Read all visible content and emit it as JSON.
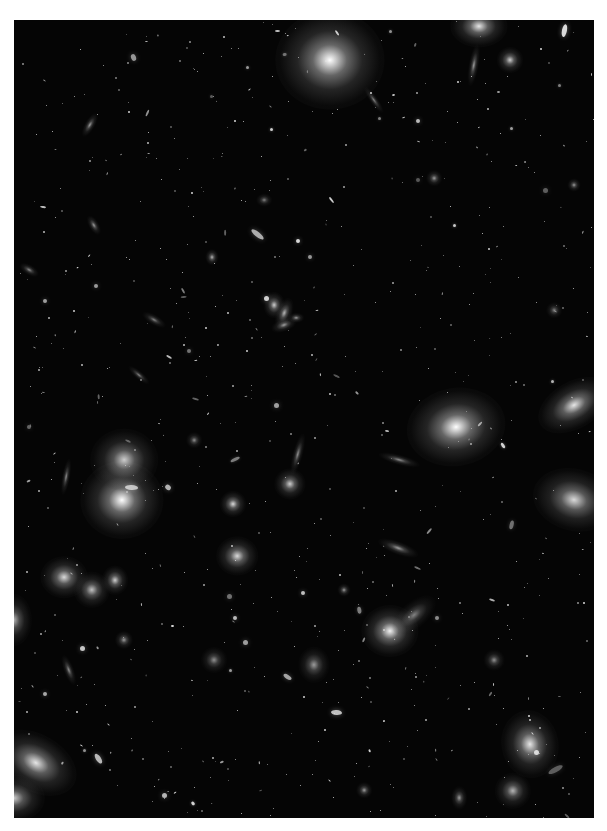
{
  "image": {
    "description": "Deep-field astronomical image: grayscale view of a galaxy cluster with many elliptical and spiral galaxies against a black sky",
    "background_color": "#050505",
    "frame_color": "#ffffff",
    "region": {
      "left": 14,
      "top": 20,
      "width": 580,
      "height": 798
    }
  },
  "galaxies": [
    {
      "x": 316,
      "y": 40,
      "rx": 42,
      "ry": 38,
      "rot": 0,
      "b": 1.0
    },
    {
      "x": 465,
      "y": 6,
      "rx": 22,
      "ry": 16,
      "rot": 0,
      "b": 0.9
    },
    {
      "x": 496,
      "y": 40,
      "rx": 10,
      "ry": 10,
      "rot": 0,
      "b": 0.8
    },
    {
      "x": 442,
      "y": 407,
      "rx": 38,
      "ry": 30,
      "rot": -10,
      "b": 1.0
    },
    {
      "x": 560,
      "y": 385,
      "rx": 30,
      "ry": 18,
      "rot": -30,
      "b": 0.9
    },
    {
      "x": 560,
      "y": 480,
      "rx": 32,
      "ry": 24,
      "rot": 15,
      "b": 0.85
    },
    {
      "x": 108,
      "y": 480,
      "rx": 32,
      "ry": 30,
      "rot": 0,
      "b": 1.0
    },
    {
      "x": 110,
      "y": 440,
      "rx": 26,
      "ry": 24,
      "rot": 0,
      "b": 0.8
    },
    {
      "x": 22,
      "y": 743,
      "rx": 34,
      "ry": 22,
      "rot": 30,
      "b": 0.9
    },
    {
      "x": 0,
      "y": 778,
      "rx": 24,
      "ry": 18,
      "rot": 0,
      "b": 0.8
    },
    {
      "x": 376,
      "y": 611,
      "rx": 22,
      "ry": 20,
      "rot": 0,
      "b": 0.95
    },
    {
      "x": 400,
      "y": 595,
      "rx": 20,
      "ry": 10,
      "rot": -40,
      "b": 0.5
    },
    {
      "x": 516,
      "y": 724,
      "rx": 22,
      "ry": 26,
      "rot": -10,
      "b": 0.9
    },
    {
      "x": 499,
      "y": 771,
      "rx": 14,
      "ry": 14,
      "rot": 0,
      "b": 0.7
    },
    {
      "x": 50,
      "y": 557,
      "rx": 18,
      "ry": 16,
      "rot": 0,
      "b": 0.85
    },
    {
      "x": 78,
      "y": 570,
      "rx": 14,
      "ry": 14,
      "rot": 0,
      "b": 0.75
    },
    {
      "x": 101,
      "y": 560,
      "rx": 10,
      "ry": 11,
      "rot": 0,
      "b": 0.8
    },
    {
      "x": 223,
      "y": 536,
      "rx": 16,
      "ry": 15,
      "rot": 0,
      "b": 0.85
    },
    {
      "x": 219,
      "y": 484,
      "rx": 10,
      "ry": 10,
      "rot": 0,
      "b": 0.85
    },
    {
      "x": 276,
      "y": 464,
      "rx": 12,
      "ry": 12,
      "rot": 0,
      "b": 0.8
    },
    {
      "x": 260,
      "y": 285,
      "rx": 8,
      "ry": 10,
      "rot": 0,
      "b": 0.8
    },
    {
      "x": 270,
      "y": 293,
      "rx": 6,
      "ry": 12,
      "rot": 20,
      "b": 0.7
    },
    {
      "x": 270,
      "y": 305,
      "rx": 10,
      "ry": 5,
      "rot": -20,
      "b": 0.6
    },
    {
      "x": 282,
      "y": 298,
      "rx": 6,
      "ry": 4,
      "rot": 0,
      "b": 0.6
    },
    {
      "x": 80,
      "y": 205,
      "rx": 4,
      "ry": 8,
      "rot": -30,
      "b": 0.6
    },
    {
      "x": 198,
      "y": 237,
      "rx": 5,
      "ry": 6,
      "rot": 0,
      "b": 0.7
    },
    {
      "x": 384,
      "y": 528,
      "rx": 16,
      "ry": 5,
      "rot": 20,
      "b": 0.6
    },
    {
      "x": 385,
      "y": 440,
      "rx": 16,
      "ry": 4,
      "rot": 15,
      "b": 0.55
    },
    {
      "x": 76,
      "y": 105,
      "rx": 4,
      "ry": 10,
      "rot": 30,
      "b": 0.6
    },
    {
      "x": 460,
      "y": 45,
      "rx": 4,
      "ry": 16,
      "rot": 10,
      "b": 0.6
    },
    {
      "x": 52,
      "y": 457,
      "rx": 3,
      "ry": 14,
      "rot": 10,
      "b": 0.55
    },
    {
      "x": 284,
      "y": 434,
      "rx": 4,
      "ry": 16,
      "rot": 15,
      "b": 0.55
    },
    {
      "x": 300,
      "y": 645,
      "rx": 12,
      "ry": 14,
      "rot": 0,
      "b": 0.6
    },
    {
      "x": 55,
      "y": 650,
      "rx": 4,
      "ry": 12,
      "rot": -20,
      "b": 0.55
    },
    {
      "x": 560,
      "y": 165,
      "rx": 5,
      "ry": 5,
      "rot": 0,
      "b": 0.6
    },
    {
      "x": 140,
      "y": 300,
      "rx": 10,
      "ry": 4,
      "rot": 30,
      "b": 0.5
    },
    {
      "x": 125,
      "y": 355,
      "rx": 10,
      "ry": 3,
      "rot": 40,
      "b": 0.5
    },
    {
      "x": 360,
      "y": 80,
      "rx": 12,
      "ry": 3,
      "rot": 55,
      "b": 0.5
    },
    {
      "x": 0,
      "y": 600,
      "rx": 14,
      "ry": 20,
      "rot": 0,
      "b": 0.7
    },
    {
      "x": 420,
      "y": 158,
      "rx": 6,
      "ry": 6,
      "rot": 0,
      "b": 0.6
    },
    {
      "x": 200,
      "y": 640,
      "rx": 10,
      "ry": 10,
      "rot": 0,
      "b": 0.55
    },
    {
      "x": 110,
      "y": 620,
      "rx": 7,
      "ry": 7,
      "rot": 0,
      "b": 0.6
    },
    {
      "x": 480,
      "y": 640,
      "rx": 8,
      "ry": 8,
      "rot": 0,
      "b": 0.55
    },
    {
      "x": 350,
      "y": 770,
      "rx": 6,
      "ry": 6,
      "rot": 0,
      "b": 0.6
    },
    {
      "x": 445,
      "y": 778,
      "rx": 6,
      "ry": 9,
      "rot": 0,
      "b": 0.6
    },
    {
      "x": 15,
      "y": 250,
      "rx": 8,
      "ry": 4,
      "rot": 30,
      "b": 0.55
    },
    {
      "x": 180,
      "y": 420,
      "rx": 6,
      "ry": 6,
      "rot": 0,
      "b": 0.55
    },
    {
      "x": 250,
      "y": 180,
      "rx": 6,
      "ry": 5,
      "rot": 0,
      "b": 0.5
    },
    {
      "x": 330,
      "y": 570,
      "rx": 5,
      "ry": 5,
      "rot": 0,
      "b": 0.6
    },
    {
      "x": 540,
      "y": 290,
      "rx": 6,
      "ry": 6,
      "rot": 0,
      "b": 0.5
    }
  ],
  "star_seed": 1234,
  "star_count": 700
}
